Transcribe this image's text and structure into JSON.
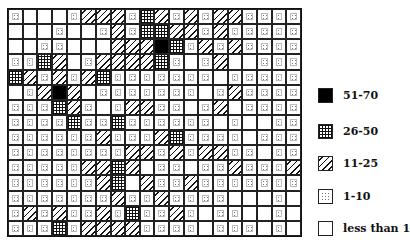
{
  "chart_data": {
    "type": "heatmap",
    "title": "",
    "rows": 15,
    "cols": 20,
    "categories": {
      "B": "51-70",
      "C": "26-50",
      "H": "11-25",
      "D": "1-10",
      "E": "less than 1"
    },
    "grid": [
      [
        "D",
        "E",
        "E",
        "E",
        "D",
        "H",
        "H",
        "H",
        "D",
        "C",
        "H",
        "D",
        "H",
        "D",
        "H",
        "H",
        "D",
        "D",
        "D",
        "D"
      ],
      [
        "E",
        "E",
        "E",
        "D",
        "E",
        "E",
        "D",
        "H",
        "D",
        "C",
        "C",
        "H",
        "H",
        "D",
        "H",
        "D",
        "D",
        "D",
        "D",
        "D"
      ],
      [
        "E",
        "E",
        "D",
        "D",
        "E",
        "E",
        "E",
        "H",
        "H",
        "H",
        "B",
        "C",
        "D",
        "H",
        "D",
        "H",
        "D",
        "D",
        "D",
        "D"
      ],
      [
        "D",
        "D",
        "C",
        "H",
        "E",
        "D",
        "H",
        "H",
        "H",
        "H",
        "C",
        "D",
        "E",
        "D",
        "H",
        "E",
        "E",
        "D",
        "D",
        "D"
      ],
      [
        "C",
        "H",
        "D",
        "H",
        "D",
        "H",
        "C",
        "D",
        "D",
        "D",
        "D",
        "D",
        "D",
        "D",
        "E",
        "D",
        "D",
        "D",
        "D",
        "D"
      ],
      [
        "E",
        "D",
        "H",
        "B",
        "H",
        "E",
        "D",
        "D",
        "D",
        "D",
        "D",
        "D",
        "D",
        "E",
        "D",
        "H",
        "D",
        "D",
        "D",
        "D"
      ],
      [
        "D",
        "D",
        "D",
        "C",
        "H",
        "D",
        "E",
        "D",
        "H",
        "H",
        "D",
        "D",
        "E",
        "D",
        "H",
        "E",
        "D",
        "D",
        "D",
        "D"
      ],
      [
        "D",
        "D",
        "D",
        "D",
        "C",
        "D",
        "D",
        "C",
        "D",
        "D",
        "D",
        "D",
        "D",
        "D",
        "E",
        "D",
        "E",
        "E",
        "D",
        "D"
      ],
      [
        "D",
        "D",
        "D",
        "D",
        "D",
        "D",
        "H",
        "D",
        "D",
        "D",
        "H",
        "C",
        "D",
        "D",
        "D",
        "D",
        "E",
        "D",
        "D",
        "D"
      ],
      [
        "D",
        "D",
        "D",
        "D",
        "D",
        "D",
        "D",
        "D",
        "H",
        "H",
        "D",
        "H",
        "D",
        "H",
        "H",
        "D",
        "D",
        "E",
        "D",
        "D"
      ],
      [
        "D",
        "D",
        "D",
        "D",
        "D",
        "H",
        "H",
        "C",
        "H",
        "E",
        "D",
        "D",
        "E",
        "D",
        "D",
        "H",
        "D",
        "D",
        "D",
        "H"
      ],
      [
        "D",
        "D",
        "D",
        "D",
        "D",
        "D",
        "H",
        "C",
        "E",
        "H",
        "D",
        "D",
        "H",
        "D",
        "D",
        "D",
        "D",
        "D",
        "D",
        "D"
      ],
      [
        "D",
        "D",
        "D",
        "D",
        "D",
        "D",
        "D",
        "H",
        "D",
        "D",
        "H",
        "D",
        "D",
        "D",
        "D",
        "E",
        "E",
        "E",
        "D",
        "E"
      ],
      [
        "D",
        "H",
        "D",
        "H",
        "D",
        "D",
        "H",
        "D",
        "C",
        "D",
        "D",
        "H",
        "D",
        "E",
        "D",
        "D",
        "E",
        "E",
        "D",
        "E"
      ],
      [
        "D",
        "D",
        "D",
        "C",
        "D",
        "H",
        "H",
        "H",
        "H",
        "D",
        "D",
        "D",
        "D",
        "E",
        "D",
        "D",
        "D",
        "E",
        "D",
        "E"
      ]
    ],
    "legend": [
      {
        "key": "B",
        "label": "51-70",
        "pattern": "solid-black"
      },
      {
        "key": "C",
        "label": "26-50",
        "pattern": "crosshatch"
      },
      {
        "key": "H",
        "label": "11-25",
        "pattern": "diagonal-hatch"
      },
      {
        "key": "D",
        "label": "1-10",
        "pattern": "dotted"
      },
      {
        "key": "E",
        "label": "less than 1",
        "pattern": "empty"
      }
    ],
    "legend_position": "right",
    "grid_lines": true
  },
  "legend": {
    "items": [
      {
        "label": "51-70",
        "top": 88
      },
      {
        "label": "26-50",
        "top": 124
      },
      {
        "label": "11-25",
        "top": 156
      },
      {
        "label": "1-10",
        "top": 189
      },
      {
        "label": "less than 1",
        "top": 221
      }
    ]
  }
}
